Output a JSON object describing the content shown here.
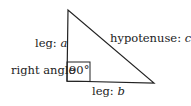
{
  "diagram": {
    "colors": {
      "stroke": "#222222",
      "text": "#222222",
      "background": "#ffffff"
    },
    "vertices": {
      "top": [
        68,
        10
      ],
      "right_angle": [
        67,
        81
      ],
      "bottom_right": [
        154,
        83
      ]
    },
    "labels": {
      "leg_a_prefix": "leg: ",
      "leg_a_var": "a",
      "hypotenuse_prefix": "hypotenuse: ",
      "hypotenuse_var": "c",
      "right_angle": "right angle",
      "angle_value": "90°",
      "leg_b_prefix": "leg: ",
      "leg_b_var": "b"
    }
  }
}
